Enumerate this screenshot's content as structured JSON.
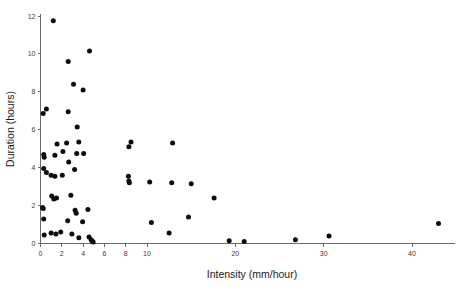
{
  "chart_data": {
    "type": "scatter",
    "title": "",
    "xlabel": "Intensity (mm/hour)",
    "ylabel": "Duration (hours)",
    "xlim": [
      0,
      44
    ],
    "ylim": [
      0,
      12.3
    ],
    "grid": false,
    "legend": null,
    "marker": "filled-circle",
    "marker_color": "#0d0d0d",
    "xticks": [
      0,
      2,
      4,
      6,
      8,
      10,
      20,
      30,
      40
    ],
    "xtick_labels": [
      "0",
      "2",
      "4",
      "6",
      "8",
      "10",
      "20",
      "30",
      "40"
    ],
    "yticks": [
      0,
      2,
      4,
      6,
      8,
      10,
      12
    ],
    "ytick_labels": [
      "0",
      "2",
      "4",
      "6",
      "8",
      "10",
      "12"
    ],
    "points": [
      [
        1.2,
        11.75
      ],
      [
        4.6,
        10.15
      ],
      [
        2.6,
        9.6
      ],
      [
        3.1,
        8.4
      ],
      [
        4.0,
        8.1
      ],
      [
        0.55,
        7.1
      ],
      [
        0.25,
        6.85
      ],
      [
        2.6,
        6.95
      ],
      [
        3.45,
        6.15
      ],
      [
        2.45,
        5.3
      ],
      [
        3.6,
        5.35
      ],
      [
        8.5,
        5.35
      ],
      [
        12.9,
        5.3
      ],
      [
        8.3,
        5.1
      ],
      [
        1.55,
        5.25
      ],
      [
        0.3,
        4.7
      ],
      [
        0.35,
        4.55
      ],
      [
        1.35,
        4.65
      ],
      [
        2.1,
        4.85
      ],
      [
        3.4,
        4.75
      ],
      [
        4.05,
        4.75
      ],
      [
        2.65,
        4.3
      ],
      [
        0.3,
        3.95
      ],
      [
        0.55,
        3.75
      ],
      [
        1.0,
        3.6
      ],
      [
        1.35,
        3.55
      ],
      [
        2.05,
        3.6
      ],
      [
        3.2,
        3.9
      ],
      [
        8.25,
        3.55
      ],
      [
        8.3,
        3.3
      ],
      [
        8.35,
        3.2
      ],
      [
        10.3,
        3.25
      ],
      [
        12.8,
        3.2
      ],
      [
        15.0,
        3.15
      ],
      [
        1.05,
        2.5
      ],
      [
        1.25,
        2.35
      ],
      [
        1.5,
        2.4
      ],
      [
        2.85,
        2.55
      ],
      [
        17.6,
        2.4
      ],
      [
        0.2,
        1.9
      ],
      [
        0.25,
        1.85
      ],
      [
        3.25,
        1.75
      ],
      [
        3.35,
        1.6
      ],
      [
        4.45,
        1.8
      ],
      [
        10.5,
        1.1
      ],
      [
        14.7,
        1.4
      ],
      [
        0.3,
        1.3
      ],
      [
        2.55,
        1.2
      ],
      [
        3.95,
        1.15
      ],
      [
        0.35,
        0.45
      ],
      [
        1.0,
        0.55
      ],
      [
        1.45,
        0.5
      ],
      [
        1.9,
        0.6
      ],
      [
        2.95,
        0.5
      ],
      [
        3.6,
        0.3
      ],
      [
        4.55,
        0.35
      ],
      [
        4.75,
        0.2
      ],
      [
        4.85,
        0.12
      ],
      [
        4.95,
        0.08
      ],
      [
        12.5,
        0.55
      ],
      [
        19.3,
        0.15
      ],
      [
        21.0,
        0.1
      ],
      [
        26.8,
        0.2
      ],
      [
        30.6,
        0.4
      ],
      [
        43.0,
        1.05
      ]
    ]
  }
}
